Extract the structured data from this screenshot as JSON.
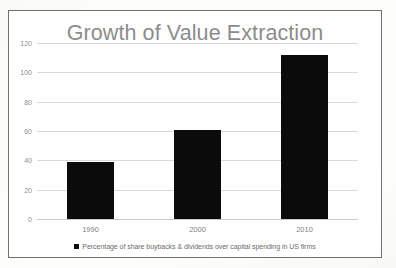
{
  "figure": {
    "frame_border_color": "#6f7073",
    "background_color": "#ffffff"
  },
  "chart_data": {
    "type": "bar",
    "title": "Growth of Value Extraction",
    "xlabel": "",
    "ylabel": "",
    "categories": [
      "1990",
      "2000",
      "2010"
    ],
    "values": [
      39,
      61,
      112
    ],
    "series": [
      {
        "name": "Percentage of share buybacks & dividends over capital spending in US firms",
        "values": [
          39,
          61,
          112
        ],
        "color": "#0b0b0b"
      }
    ],
    "ylim": [
      0,
      120
    ],
    "yticks": [
      0,
      20,
      40,
      60,
      80,
      100,
      120
    ],
    "ytick_labels": [
      "0",
      "20",
      "40",
      "60",
      "80",
      "100",
      "120"
    ],
    "grid": true,
    "grid_axis": "y",
    "grid_color": "#d9d9d9",
    "legend": {
      "position": "bottom",
      "entries": [
        {
          "label": "Percentage of share buybacks & dividends over capital spending in US firms",
          "marker": "square",
          "color": "#0b0b0b"
        }
      ]
    }
  }
}
